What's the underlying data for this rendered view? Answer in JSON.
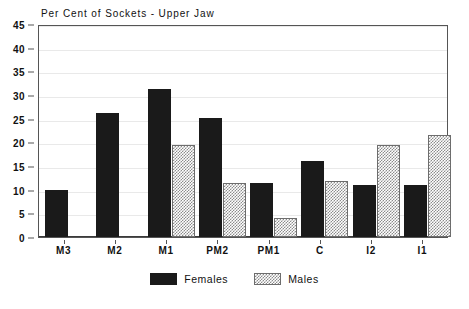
{
  "chart_data": {
    "type": "bar",
    "title": "Per Cent of Sockets - Upper Jaw",
    "xlabel": "",
    "ylabel": "",
    "ylim": [
      0,
      45
    ],
    "ytick_step": 5,
    "yticks": [
      "0",
      "5",
      "10",
      "15",
      "20",
      "25",
      "30",
      "35",
      "40",
      "45"
    ],
    "grid": true,
    "legend_position": "bottom-center",
    "categories": [
      "M3",
      "M2",
      "M1",
      "PM2",
      "PM1",
      "C",
      "I2",
      "I1"
    ],
    "series": [
      {
        "name": "Females",
        "swatch": "solid-black",
        "color": "#1a1a1a",
        "values": [
          10.0,
          26.3,
          31.3,
          25.1,
          11.4,
          16.1,
          10.9,
          11.0
        ]
      },
      {
        "name": "Males",
        "swatch": "checkered-hatch",
        "color": "#8c8c8c",
        "values": [
          null,
          null,
          19.5,
          11.4,
          4.1,
          11.8,
          19.5,
          21.5
        ]
      }
    ]
  },
  "legend": {
    "entries": [
      {
        "label": "Females"
      },
      {
        "label": "Males"
      }
    ]
  }
}
